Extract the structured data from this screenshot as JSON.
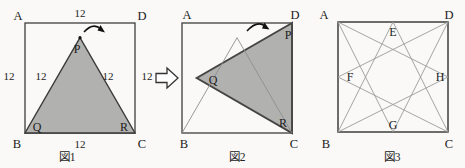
{
  "figure1": {
    "caption": "図1",
    "corners": {
      "top_left": "A",
      "top_right": "D",
      "bottom_left": "B",
      "bottom_right": "C"
    },
    "triangle_points": {
      "apex": "P",
      "bottom_left": "Q",
      "bottom_right": "R"
    },
    "side_lengths": {
      "top": "12",
      "left": "12",
      "right": "12",
      "bottom": "12",
      "slant_left": "12",
      "slant_right": "12"
    }
  },
  "figure2": {
    "caption": "図2",
    "corners": {
      "top_left": "A",
      "top_right": "D",
      "bottom_left": "B",
      "bottom_right": "C"
    },
    "triangle_points": {
      "near_d": "P",
      "left_vertex": "Q",
      "near_c": "R"
    }
  },
  "figure3": {
    "caption": "図3",
    "corners": {
      "top_left": "A",
      "top_right": "D",
      "bottom_left": "B",
      "bottom_right": "C"
    },
    "midpoints": {
      "top": "E",
      "left": "F",
      "bottom": "G",
      "right": "H"
    }
  },
  "colors": {
    "triangle_fill": "#b1b1af",
    "outline": "#3e3e3e",
    "thin_line": "#8f8f8f",
    "arrow": "#111111"
  }
}
